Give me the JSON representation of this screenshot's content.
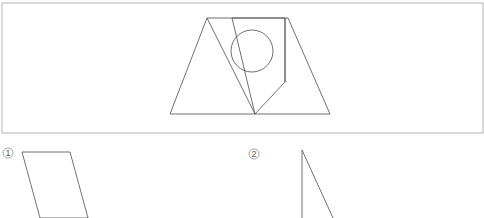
{
  "canvas": {
    "width": 484,
    "height": 218,
    "background": "#ffffff"
  },
  "colors": {
    "panel_border": "#b3b3b3",
    "figure_stroke": "#4d4d4d",
    "label_stroke": "#8c8c8c",
    "label_text": "#5a5a5a",
    "background": "#ffffff"
  },
  "panel": {
    "name": "figure-panel",
    "x": 2,
    "y": 3,
    "width": 481,
    "height": 130,
    "border_width": 1
  },
  "main_figure": {
    "name": "composite-geometry-figure",
    "description": "Trapezoid containing an inscribed triangle, a slanted quadrilateral and a circle",
    "stroke_width": 0.8,
    "trapezoid": {
      "name": "outer-trapezoid",
      "points": "207,18 288,18 330,114 170,114"
    },
    "inner_triangle": {
      "name": "inner-left-triangle",
      "points": "207,18 255,114 170,114"
    },
    "slanted_quadrilateral": {
      "name": "slanted-quadrilateral",
      "points": "232,18 285,18 285,82 255,114"
    },
    "vertical_divider": {
      "name": "vertical-divider-line",
      "x1": 285,
      "y1": 18,
      "x2": 285,
      "y2": 82
    },
    "right_edge_line": {
      "name": "trapezoid-right-edge",
      "x1": 288,
      "y1": 18,
      "x2": 330,
      "y2": 114
    },
    "circle": {
      "name": "inscribed-circle",
      "cx": 252,
      "cy": 51,
      "r": 21
    }
  },
  "answer_options": [
    {
      "id": "option-1",
      "marker_label": "1",
      "marker_cx": 8,
      "marker_cy": 153,
      "marker_r": 5,
      "shape_name": "parallelogram-option",
      "shape_points": "22,152 70,152 88,218 40,218",
      "stroke_width": 0.8
    },
    {
      "id": "option-2",
      "marker_label": "2",
      "marker_cx": 254,
      "marker_cy": 154,
      "marker_r": 5,
      "shape_name": "sliver-triangle-option",
      "shape_points": "302,150 302,218 333,218",
      "stroke_width": 0.8
    }
  ]
}
